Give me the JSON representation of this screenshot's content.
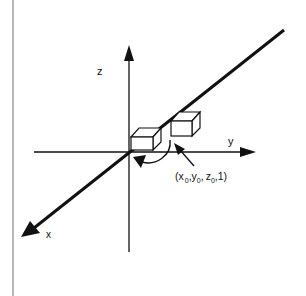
{
  "diagram": {
    "axes": {
      "z_label": "z",
      "y_label": "y",
      "x_label": "x"
    },
    "point_label": {
      "open": "(",
      "x": "x",
      "x_sub": "0",
      "sep1": ",",
      "y": "y",
      "y_sub": "0",
      "sep2": ",",
      "z": "z",
      "z_sub": "0",
      "tail": ",1)"
    },
    "colors": {
      "line": "#111111",
      "border": "#888888",
      "background": "#ffffff"
    }
  }
}
